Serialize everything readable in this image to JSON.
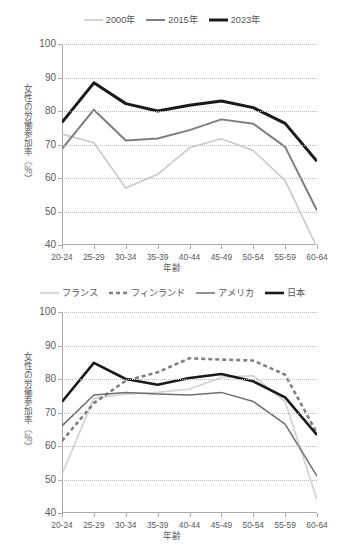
{
  "figures": [
    {
      "id": "top",
      "legend": [
        {
          "label": "2000年",
          "color": "#c9c9c9",
          "width": 1.6,
          "dash": "none"
        },
        {
          "label": "2015年",
          "color": "#7d7d7d",
          "width": 2.0,
          "dash": "none"
        },
        {
          "label": "2023年",
          "color": "#1a1a1a",
          "width": 3.0,
          "dash": "none"
        }
      ],
      "axis": {
        "xlabel": "年齢",
        "ylabel": "女性の労働参加率（％）"
      }
    },
    {
      "id": "bottom",
      "legend": [
        {
          "label": "フランス",
          "color": "#d5d5d5",
          "width": 1.8,
          "dash": "none"
        },
        {
          "label": "フィンランド",
          "color": "#808080",
          "width": 2.6,
          "dash": "4,3"
        },
        {
          "label": "アメリカ",
          "color": "#6e6e6e",
          "width": 1.5,
          "dash": "none"
        },
        {
          "label": "日本",
          "color": "#1a1a1a",
          "width": 2.6,
          "dash": "none"
        }
      ],
      "axis": {
        "xlabel": "年齢",
        "ylabel": "女性の労働参加率（％）"
      }
    }
  ],
  "chart_data": [
    {
      "type": "line",
      "title": "",
      "xlabel": "年齢",
      "ylabel": "女性の労働参加率（％）",
      "ylim": [
        40,
        100
      ],
      "yticks": [
        40,
        50,
        60,
        70,
        80,
        90,
        100
      ],
      "grid": true,
      "legend_position": "top-center",
      "categories": [
        "20-24",
        "25-29",
        "30-34",
        "35-39",
        "40-44",
        "45-49",
        "50-54",
        "55-59",
        "60-64"
      ],
      "series": [
        {
          "name": "2000年",
          "color": "#c9c9c9",
          "values": [
            73.1,
            70.5,
            57.0,
            61.1,
            69.0,
            71.7,
            68.2,
            59.2,
            39.3
          ]
        },
        {
          "name": "2015年",
          "color": "#7d7d7d",
          "values": [
            68.7,
            80.4,
            71.2,
            71.8,
            74.3,
            77.5,
            76.2,
            69.3,
            50.3
          ]
        },
        {
          "name": "2023年",
          "color": "#1a1a1a",
          "values": [
            76.6,
            88.4,
            82.2,
            80.0,
            81.7,
            83.0,
            81.0,
            76.3,
            65.0
          ]
        }
      ]
    },
    {
      "type": "line",
      "title": "",
      "xlabel": "年齢",
      "ylabel": "女性の労働参加率（％）",
      "ylim": [
        40,
        100
      ],
      "yticks": [
        40,
        50,
        60,
        70,
        80,
        90,
        100
      ],
      "grid": true,
      "legend_position": "top-center",
      "categories": [
        "20-24",
        "25-29",
        "30-34",
        "35-39",
        "40-44",
        "45-49",
        "50-54",
        "55-59",
        "60-64"
      ],
      "series": [
        {
          "name": "フランス",
          "color": "#d5d5d5",
          "values": [
            51.5,
            74.3,
            75.5,
            76.0,
            77.0,
            80.5,
            81.0,
            73.2,
            44.0
          ]
        },
        {
          "name": "フィンランド",
          "color": "#808080",
          "values": [
            61.5,
            72.8,
            79.5,
            82.0,
            86.2,
            85.8,
            85.5,
            81.3,
            63.8
          ]
        },
        {
          "name": "アメリカ",
          "color": "#6e6e6e",
          "values": [
            66.0,
            75.2,
            76.0,
            75.5,
            75.2,
            76.0,
            73.3,
            66.5,
            51.0
          ]
        },
        {
          "name": "日本",
          "color": "#1a1a1a",
          "values": [
            73.2,
            84.8,
            80.0,
            78.3,
            80.3,
            81.5,
            79.3,
            74.5,
            63.3
          ]
        }
      ]
    }
  ]
}
